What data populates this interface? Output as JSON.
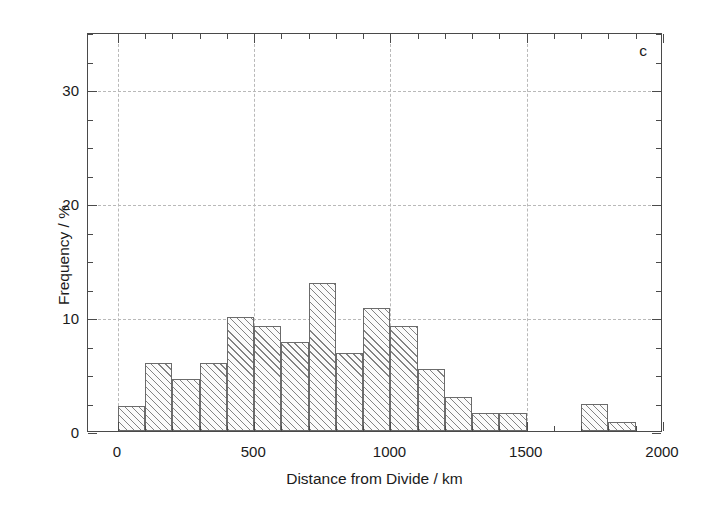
{
  "figure": {
    "panel_label": "c"
  },
  "axes": {
    "x_title": "Distance from Divide / km",
    "y_title": "Frequency / %",
    "x_ticks": [
      "0",
      "500",
      "1000",
      "1500",
      "2000"
    ],
    "y_ticks": [
      "0",
      "10",
      "20",
      "30"
    ]
  },
  "chart_data": {
    "type": "bar",
    "title": "",
    "subtitle": "",
    "panel_label": "c",
    "xlabel": "Distance from Divide / km",
    "ylabel": "Frequency / %",
    "xlim": [
      -110,
      2000
    ],
    "ylim": [
      0,
      35
    ],
    "xticks": [
      0,
      500,
      1000,
      1500,
      2000
    ],
    "yticks": [
      0,
      10,
      20,
      30
    ],
    "x_minor_tick_interval": 100,
    "y_minor_tick_interval": 2.5,
    "grid": true,
    "grid_style": "dashed",
    "grid_color": "#b9b9b9",
    "legend": false,
    "bar_fill": "hatched-45deg",
    "bar_edge_color": "#6b6b6b",
    "bin_width": 100,
    "bin_edges": [
      0,
      100,
      200,
      300,
      400,
      500,
      600,
      700,
      800,
      900,
      1000,
      1100,
      1200,
      1300,
      1400,
      1500,
      1700,
      1800,
      1900
    ],
    "bins": [
      {
        "x0": 0,
        "x1": 100,
        "center": 50,
        "value": 2.2
      },
      {
        "x0": 100,
        "x1": 200,
        "center": 150,
        "value": 6.0
      },
      {
        "x0": 200,
        "x1": 300,
        "center": 250,
        "value": 4.6
      },
      {
        "x0": 300,
        "x1": 400,
        "center": 350,
        "value": 6.0
      },
      {
        "x0": 400,
        "x1": 500,
        "center": 450,
        "value": 10.0
      },
      {
        "x0": 500,
        "x1": 600,
        "center": 550,
        "value": 9.2
      },
      {
        "x0": 600,
        "x1": 700,
        "center": 650,
        "value": 7.8
      },
      {
        "x0": 700,
        "x1": 800,
        "center": 750,
        "value": 13.0
      },
      {
        "x0": 800,
        "x1": 900,
        "center": 850,
        "value": 6.8
      },
      {
        "x0": 900,
        "x1": 1000,
        "center": 950,
        "value": 10.8
      },
      {
        "x0": 1000,
        "x1": 1100,
        "center": 1050,
        "value": 9.2
      },
      {
        "x0": 1100,
        "x1": 1200,
        "center": 1150,
        "value": 5.4
      },
      {
        "x0": 1200,
        "x1": 1300,
        "center": 1250,
        "value": 3.0
      },
      {
        "x0": 1300,
        "x1": 1400,
        "center": 1350,
        "value": 1.6
      },
      {
        "x0": 1400,
        "x1": 1500,
        "center": 1450,
        "value": 1.6
      },
      {
        "x0": 1700,
        "x1": 1800,
        "center": 1750,
        "value": 2.4
      },
      {
        "x0": 1800,
        "x1": 1900,
        "center": 1850,
        "value": 0.8
      }
    ],
    "categories": [
      "0-100",
      "100-200",
      "200-300",
      "300-400",
      "400-500",
      "500-600",
      "600-700",
      "700-800",
      "800-900",
      "900-1000",
      "1000-1100",
      "1100-1200",
      "1200-1300",
      "1300-1400",
      "1400-1500",
      "1700-1800",
      "1800-1900"
    ],
    "values": [
      2.2,
      6.0,
      4.6,
      6.0,
      10.0,
      9.2,
      7.8,
      13.0,
      6.8,
      10.8,
      9.2,
      5.4,
      3.0,
      1.6,
      1.6,
      2.4,
      0.8
    ]
  }
}
